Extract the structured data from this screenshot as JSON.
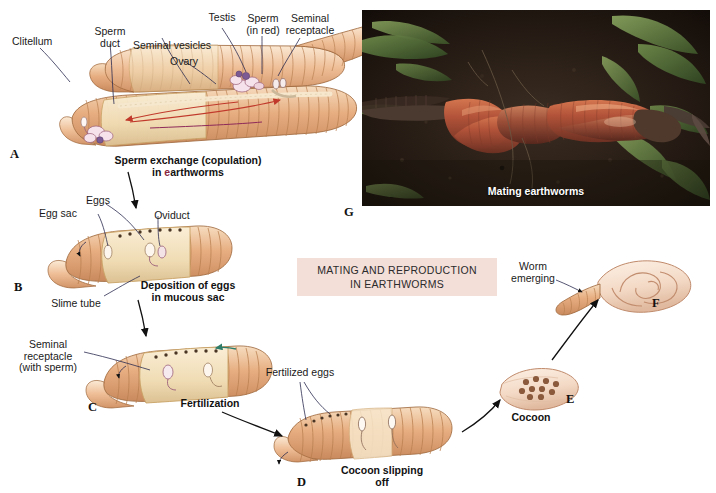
{
  "figure": {
    "background": "#ffffff",
    "title_box": {
      "line1": "MATING AND REPRODUCTION",
      "line2": "IN EARTHWORMS",
      "bg_color": "#f3ded8",
      "text_color": "#2b2b2b"
    }
  },
  "panels": [
    {
      "letter": "A",
      "caption_line1": "Sperm exchange (copulation)",
      "caption_line2": "in earthworms",
      "labels": [
        "Clitellum",
        "Sperm\nduct",
        "Seminal vesicles",
        "Ovary",
        "Testis",
        "Sperm\n(in red)",
        "Seminal\nreceptacle"
      ]
    },
    {
      "letter": "B",
      "caption_line1": "Deposition of eggs",
      "caption_line2": "in mucous sac",
      "labels": [
        "Eggs",
        "Egg sac",
        "Oviduct",
        "Slime tube"
      ]
    },
    {
      "letter": "C",
      "caption_line1": "Fertilization",
      "caption_line2": "",
      "labels": [
        "Seminal\nreceptacle\n(with sperm)"
      ]
    },
    {
      "letter": "D",
      "caption_line1": "Cocoon slipping",
      "caption_line2": "off",
      "labels": [
        "Fertilized eggs"
      ]
    },
    {
      "letter": "E",
      "caption_line1": "Cocoon",
      "caption_line2": "",
      "labels": []
    },
    {
      "letter": "F",
      "caption_line1": "",
      "caption_line2": "",
      "labels": [
        "Worm\nemerging"
      ]
    },
    {
      "letter": "G",
      "caption_line1": "Mating earthworms",
      "caption_line2": "",
      "labels": []
    }
  ],
  "colors": {
    "worm_body": "#e3a97c",
    "worm_light": "#f2d5b4",
    "clitellum": "#f0dcb8",
    "sperm_arrow": "#c0392b",
    "green_arrow": "#2e7d6b",
    "cocoon_egg": "#8b5a3c",
    "leader_line": "#2b2b50",
    "connector_arrow": "#111111"
  }
}
